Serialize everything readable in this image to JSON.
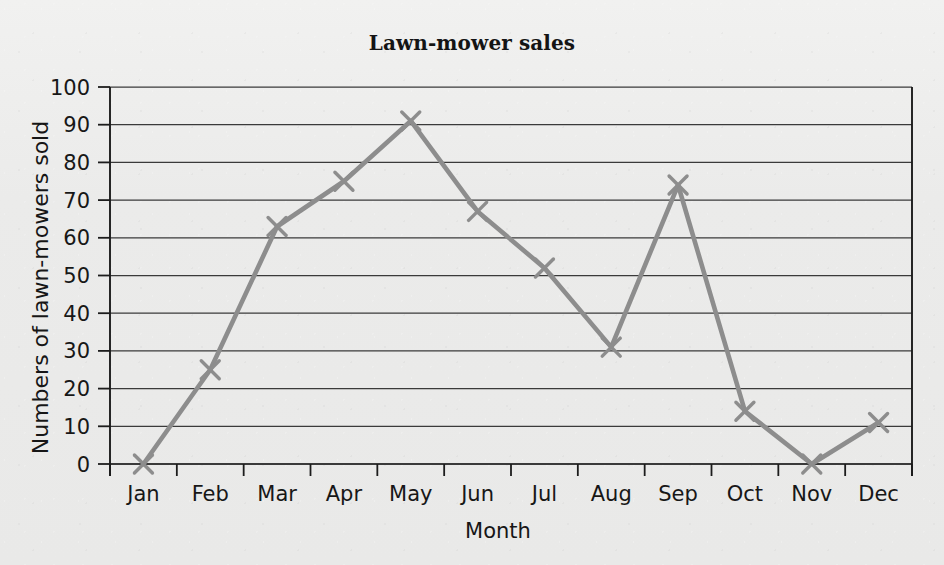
{
  "chart_data": {
    "type": "line",
    "title": "Lawn-mower sales",
    "xlabel": "Month",
    "ylabel": "Numbers of lawn-mowers sold",
    "categories": [
      "Jan",
      "Feb",
      "Mar",
      "Apr",
      "May",
      "Jun",
      "Jul",
      "Aug",
      "Sep",
      "Oct",
      "Nov",
      "Dec"
    ],
    "values": [
      0,
      25,
      63,
      75,
      91,
      67,
      52,
      31,
      74,
      14,
      0,
      11
    ],
    "series": [
      {
        "name": "Lawn-mower sales",
        "values": [
          0,
          25,
          63,
          75,
          91,
          67,
          52,
          31,
          74,
          14,
          0,
          11
        ]
      }
    ],
    "ylim": [
      0,
      100
    ],
    "yticks": [
      0,
      10,
      20,
      30,
      40,
      50,
      60,
      70,
      80,
      90,
      100
    ],
    "ytick_labels": [
      "0",
      "10",
      "20",
      "30",
      "40",
      "50",
      "60",
      "70",
      "80",
      "90",
      "100"
    ],
    "grid": "horizontal",
    "legend": "none",
    "marker": "x",
    "line_color": "#8d8d8d",
    "marker_color": "#8d8d8d",
    "grid_color": "#3a3a3a",
    "axis_color": "#1c1c1c",
    "background_color": "#ebebea",
    "text_color": "#171717"
  }
}
